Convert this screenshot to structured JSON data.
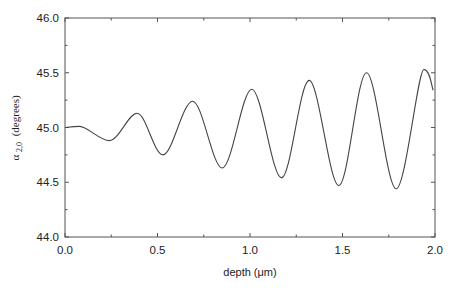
{
  "chart_data": {
    "type": "line",
    "title": "",
    "xlabel": "depth (μm)",
    "ylabel": "α 2,0 (degrees)",
    "ylabel_parts": {
      "symbol": "α",
      "subscript": "2,0",
      "unit": "(degrees)"
    },
    "xlim": [
      0.0,
      2.0
    ],
    "ylim": [
      44.0,
      46.0
    ],
    "x_ticks": [
      "0.0",
      "0.5",
      "1.0",
      "1.5",
      "2.0"
    ],
    "y_ticks": [
      "44.0",
      "44.5",
      "45.0",
      "45.5",
      "46.0"
    ],
    "grid": false,
    "legend": null,
    "series": [
      {
        "name": "alpha_2_0",
        "x": [
          0.0,
          0.08,
          0.24,
          0.39,
          0.53,
          0.69,
          0.85,
          1.01,
          1.17,
          1.32,
          1.48,
          1.63,
          1.79,
          1.94,
          1.99
        ],
        "y": [
          45.0,
          45.01,
          44.88,
          45.13,
          44.75,
          45.24,
          44.63,
          45.35,
          44.54,
          45.43,
          44.47,
          45.5,
          44.44,
          45.53,
          45.34
        ]
      }
    ]
  }
}
